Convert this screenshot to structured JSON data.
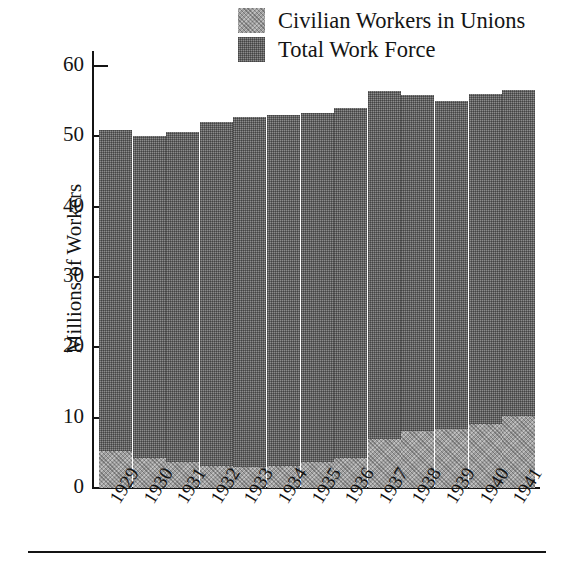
{
  "chart_data": {
    "type": "bar",
    "title": "",
    "subtitle": "",
    "xlabel": "",
    "ylabel": "Millions of Workers",
    "ylim": [
      0,
      63
    ],
    "yticks": [
      0,
      10,
      20,
      30,
      40,
      50,
      60
    ],
    "ytick_labels": [
      "0",
      "10",
      "20",
      "30",
      "40",
      "50",
      "60"
    ],
    "grid": false,
    "stacked": true,
    "legend_position": "top-right",
    "categories": [
      "1929",
      "1930",
      "1931",
      "1932",
      "1933",
      "1934",
      "1935",
      "1936",
      "1937",
      "1938",
      "1939",
      "1940",
      "1941"
    ],
    "series": [
      {
        "name": "Civilian Workers in Unions",
        "color": "#9e9e9e",
        "values": [
          5.2,
          4.2,
          3.7,
          3.2,
          3.0,
          3.2,
          3.7,
          4.2,
          7.0,
          8.1,
          8.4,
          9.1,
          10.3
        ]
      },
      {
        "name": "Total Work Force",
        "color": "#8c8c8c",
        "values": [
          50.9,
          50.1,
          50.6,
          52.1,
          52.8,
          53.1,
          53.4,
          54.1,
          56.4,
          55.9,
          55.0,
          56.0,
          56.6
        ]
      }
    ],
    "annotations": []
  },
  "legend": {
    "entries": [
      {
        "label": "Civilian Workers in Unions",
        "swatch": "light-hatch-swatch"
      },
      {
        "label": "Total Work Force",
        "swatch": "dark-hatch-swatch"
      }
    ]
  },
  "axes": {
    "y_title": "Millions of Workers"
  }
}
